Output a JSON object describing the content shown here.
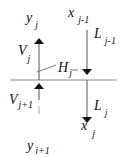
{
  "diagram": {
    "colors": {
      "line": "#8a8a8a",
      "arrow": "#111111",
      "text": "#111111"
    },
    "labels": {
      "y_top": {
        "base": "y",
        "sub": "j"
      },
      "x_top": {
        "base": "x",
        "sub": "j-1"
      },
      "L_top": {
        "base": "L",
        "sub": "j-1"
      },
      "V_top": {
        "base": "V",
        "sub": "j"
      },
      "H": {
        "base": "H",
        "sub": "j"
      },
      "V_bottom": {
        "base": "V",
        "sub": "j+1"
      },
      "L_bottom": {
        "base": "L",
        "sub": "j"
      },
      "x_bottom": {
        "base": "x",
        "sub": "j"
      },
      "y_bottom": {
        "base": "y",
        "sub": "i+1"
      }
    }
  }
}
